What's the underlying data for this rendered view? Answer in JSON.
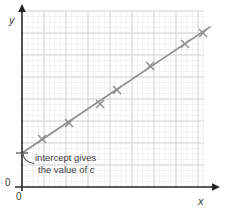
{
  "labels": {
    "y_axis": "y",
    "x_axis": "x",
    "origin_y": "0",
    "origin_x": "0"
  },
  "annotation": {
    "line1": "intercept gives",
    "line2_prefix": "the value of ",
    "line2_italic": "c"
  },
  "chart_data": {
    "type": "scatter",
    "title": "",
    "xlabel": "x",
    "ylabel": "y",
    "marker": "cross",
    "grid": "graph-paper with major and minor gridlines",
    "axis_tick_labels_shown": {
      "x": [
        "0"
      ],
      "y": [
        "0"
      ]
    },
    "x_range_units": [
      0,
      8.9
    ],
    "y_range_units": [
      0,
      8.3
    ],
    "points_units": [
      [
        0.91,
        2.18
      ],
      [
        2.14,
        2.91
      ],
      [
        3.55,
        3.77
      ],
      [
        4.32,
        4.41
      ],
      [
        5.82,
        5.5
      ],
      [
        7.41,
        6.5
      ],
      [
        8.23,
        7.0
      ]
    ],
    "best_fit_line_units": {
      "y_intercept_c": 1.55,
      "slope_m": 0.67,
      "x_start": 0,
      "x_end": 8.55
    },
    "annotation_text": "intercept gives the value of c",
    "colors": {
      "axis": "#262626",
      "grid_major": "#d5d6d8",
      "grid_minor": "#ededee",
      "line": "#8d8f90",
      "marker": "#8d8f90",
      "annotation": "#4a4a4a",
      "text": "#3a3a3a"
    },
    "pixel_layout": {
      "origin_px": [
        22,
        187
      ],
      "px_per_unit": 22,
      "grid_minor_px": 5.5,
      "grid_rect": [
        22,
        11,
        204,
        187
      ],
      "y_axis_top_px": 4,
      "y_axis_bottom_px": 191,
      "x_axis_left_px": 15,
      "x_axis_right_px": 220,
      "intercept_tick": [
        16,
        28,
        153
      ],
      "leader_path": "M 34 163.5 Q 24 162 23.2 154.5",
      "cross_half_px": 4
    }
  }
}
